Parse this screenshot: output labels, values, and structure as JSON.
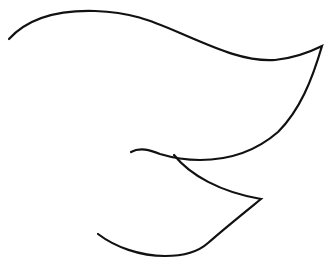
{
  "drawing": {
    "description": "Minimal black line-art sketch on white background, resembling a stylized leaf / bird wing shape",
    "background": "#ffffff",
    "stroke_color": "#111111",
    "stroke_width": 2.2,
    "paths": [
      {
        "name": "upper-wing-curve",
        "d": "M 9 39 C 30 16, 62 10, 95 11 C 130 12, 150 20, 180 33 C 215 48, 245 62, 275 60 C 295 58, 310 52, 322 46 C 312 80, 300 110, 278 132 C 255 152, 228 160, 200 160 C 182 160, 170 157, 160 154 C 150 150, 140 147, 131 152"
      },
      {
        "name": "lower-wing-curve",
        "d": "M 174 155 C 190 175, 220 192, 261 199 C 245 212, 225 228, 208 243 C 198 252, 182 256, 165 256 C 140 256, 115 247, 98 234"
      }
    ]
  }
}
